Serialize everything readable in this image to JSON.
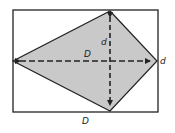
{
  "diagram": {
    "colors": {
      "stroke": "#222222",
      "fill": "#c9c9c9",
      "background": "#ffffff"
    },
    "rectangle": {
      "x": 13,
      "y": 10,
      "width": 145,
      "height": 102
    },
    "kite": {
      "vertices": [
        [
          110,
          11
        ],
        [
          157,
          61
        ],
        [
          110,
          111
        ],
        [
          13,
          61
        ]
      ]
    },
    "diagonals": {
      "long": {
        "label": "D",
        "from": [
          14,
          61
        ],
        "to": [
          156,
          61
        ]
      },
      "short": {
        "label": "d",
        "from": [
          110,
          12
        ],
        "to": [
          110,
          110
        ]
      }
    },
    "labels": {
      "short_diagonal": "d",
      "long_diagonal": "D",
      "rect_height": "d",
      "rect_width": "D"
    }
  }
}
